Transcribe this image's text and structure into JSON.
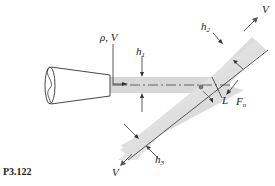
{
  "figure": {
    "problem_label": "P3.122",
    "labels": {
      "density_velocity": "ρ, V",
      "h1_main": "h",
      "h1_sub": "1",
      "h2_main": "h",
      "h2_sub": "2",
      "h3_main": "h",
      "h3_sub": "3",
      "L": "L",
      "Fn_main": "F",
      "Fn_sub": "n",
      "V_upper": "V",
      "V_lower": "V"
    },
    "colors": {
      "jet": "#d9d9d9",
      "plate": "#e4e4e4",
      "plate_edge": "#555555",
      "line": "#333333"
    }
  }
}
